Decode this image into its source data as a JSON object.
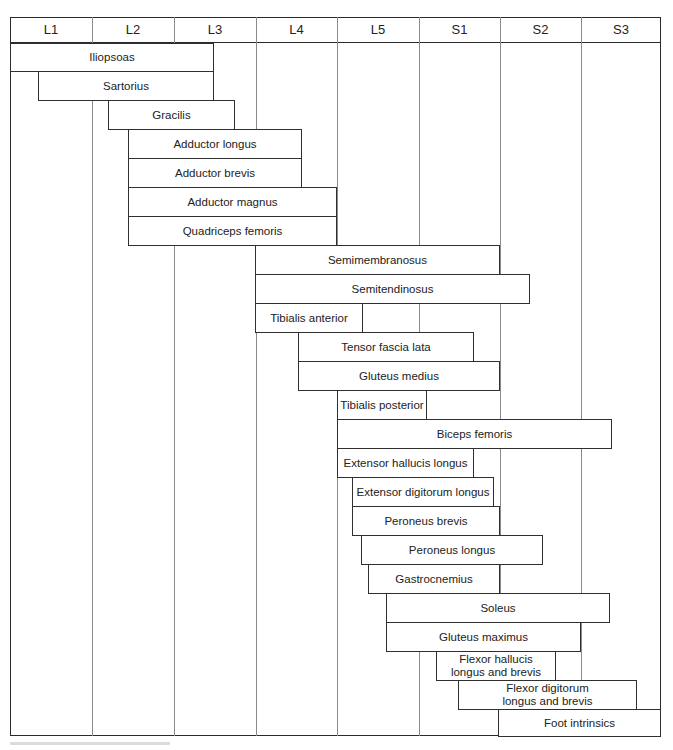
{
  "chart_data": {
    "type": "diagram",
    "title": "",
    "columns": [
      "L1",
      "L2",
      "L3",
      "L4",
      "L5",
      "S1",
      "S2",
      "S3"
    ],
    "muscles": [
      {
        "name": "Iliopsoas",
        "start": 0.0,
        "end": 2.5
      },
      {
        "name": "Sartorius",
        "start": 0.35,
        "end": 2.5
      },
      {
        "name": "Gracilis",
        "start": 1.2,
        "end": 2.75
      },
      {
        "name": "Adductor longus",
        "start": 1.45,
        "end": 3.6
      },
      {
        "name": "Adductor brevis",
        "start": 1.45,
        "end": 3.6
      },
      {
        "name": "Adductor magnus",
        "start": 1.45,
        "end": 4.0
      },
      {
        "name": "Quadriceps femoris",
        "start": 1.45,
        "end": 4.0
      },
      {
        "name": "Semimembranosus",
        "start": 3.0,
        "end": 6.0
      },
      {
        "name": "Semitendinosus",
        "start": 3.0,
        "end": 6.4
      },
      {
        "name": "Tibialis anterior",
        "start": 3.0,
        "end": 4.3
      },
      {
        "name": "Tensor fascia lata",
        "start": 3.5,
        "end": 5.7
      },
      {
        "name": "Gluteus medius",
        "start": 3.5,
        "end": 6.0
      },
      {
        "name": "Tibialis posterior",
        "start": 4.0,
        "end": 5.1
      },
      {
        "name": "Biceps femoris",
        "start": 4.0,
        "end": 7.4
      },
      {
        "name": "Extensor hallucis longus",
        "start": 4.0,
        "end": 5.7
      },
      {
        "name": "Extensor digitorum longus",
        "start": 4.2,
        "end": 5.95
      },
      {
        "name": "Peroneus brevis",
        "start": 4.2,
        "end": 6.0
      },
      {
        "name": "Peroneus longus",
        "start": 4.3,
        "end": 6.55
      },
      {
        "name": "Gastrocnemius",
        "start": 4.4,
        "end": 6.0
      },
      {
        "name": "Soleus",
        "start": 4.6,
        "end": 7.35
      },
      {
        "name": "Gluteus maximus",
        "start": 4.6,
        "end": 7.0
      },
      {
        "name": "Flexor hallucis longus and brevis",
        "start": 5.25,
        "end": 6.7
      },
      {
        "name": "Flexor digitorum longus and brevis",
        "start": 5.5,
        "end": 7.7
      },
      {
        "name": "Foot intrinsics",
        "start": 6.0,
        "end": 8.0
      }
    ],
    "grid": true
  },
  "header": {
    "columns": [
      "L1",
      "L2",
      "L3",
      "L4",
      "L5",
      "S1",
      "S2",
      "S3"
    ]
  },
  "bars": [
    {
      "label": "Iliopsoas",
      "x1": 10,
      "x2": 214,
      "y1": 43,
      "y2": 71
    },
    {
      "label": "Sartorius",
      "x1": 38,
      "x2": 214,
      "y1": 71,
      "y2": 100
    },
    {
      "label": "Gracilis",
      "x1": 108,
      "x2": 235,
      "y1": 100,
      "y2": 129
    },
    {
      "label": "Adductor longus",
      "x1": 128,
      "x2": 302,
      "y1": 129,
      "y2": 158
    },
    {
      "label": "Adductor brevis",
      "x1": 128,
      "x2": 302,
      "y1": 158,
      "y2": 187
    },
    {
      "label": "Adductor magnus",
      "x1": 128,
      "x2": 337,
      "y1": 187,
      "y2": 216
    },
    {
      "label": "Quadriceps femoris",
      "x1": 128,
      "x2": 337,
      "y1": 216,
      "y2": 245
    },
    {
      "label": "Semimembranosus",
      "x1": 255,
      "x2": 500,
      "y1": 245,
      "y2": 274
    },
    {
      "label": "Semitendinosus",
      "x1": 255,
      "x2": 530,
      "y1": 274,
      "y2": 303
    },
    {
      "label": "Tibialis anterior",
      "x1": 255,
      "x2": 363,
      "y1": 303,
      "y2": 332
    },
    {
      "label": "Tensor fascia lata",
      "x1": 298,
      "x2": 474,
      "y1": 332,
      "y2": 361
    },
    {
      "label": "Gluteus medius",
      "x1": 298,
      "x2": 500,
      "y1": 361,
      "y2": 390
    },
    {
      "label": "Tibialis posterior",
      "x1": 337,
      "x2": 427,
      "y1": 390,
      "y2": 419
    },
    {
      "label": "Biceps femoris",
      "x1": 337,
      "x2": 612,
      "y1": 419,
      "y2": 448
    },
    {
      "label": "Extensor hallucis longus",
      "x1": 337,
      "x2": 474,
      "y1": 448,
      "y2": 477
    },
    {
      "label": "Extensor digitorum longus",
      "x1": 352,
      "x2": 494,
      "y1": 477,
      "y2": 506
    },
    {
      "label": "Peroneus brevis",
      "x1": 352,
      "x2": 500,
      "y1": 506,
      "y2": 535
    },
    {
      "label": "Peroneus longus",
      "x1": 361,
      "x2": 543,
      "y1": 535,
      "y2": 564
    },
    {
      "label": "Gastrocnemius",
      "x1": 368,
      "x2": 500,
      "y1": 564,
      "y2": 593
    },
    {
      "label": "Soleus",
      "x1": 386,
      "x2": 610,
      "y1": 593,
      "y2": 622
    },
    {
      "label": "Gluteus maximus",
      "x1": 386,
      "x2": 581,
      "y1": 622,
      "y2": 651
    },
    {
      "label": "Flexor hallucis\nlongus and brevis",
      "x1": 436,
      "x2": 556,
      "y1": 651,
      "y2": 680
    },
    {
      "label": "Flexor digitorum\nlongus and brevis",
      "x1": 458,
      "x2": 637,
      "y1": 680,
      "y2": 709
    },
    {
      "label": "Foot intrinsics",
      "x1": 498,
      "x2": 661,
      "y1": 709,
      "y2": 736
    }
  ],
  "grid_lines_x": [
    92,
    174,
    256,
    337,
    419,
    500,
    581
  ],
  "colors": {
    "border": "#2a2a2a",
    "grid": "#8a8a8a",
    "background": "#ffffff",
    "text": "#222222"
  }
}
